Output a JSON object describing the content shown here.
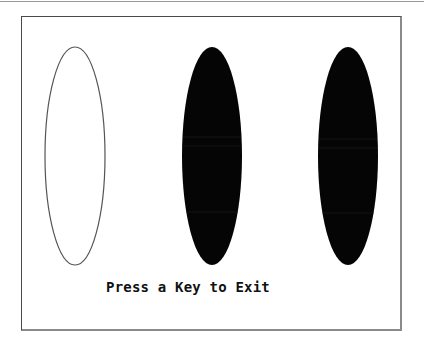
{
  "screen": {
    "prompt_text": "Press a Key to Exit",
    "background_color": "#ffffff",
    "frame_color": "#4a4a4a"
  },
  "shapes": [
    {
      "id": "ellipse-outline",
      "cx": 75,
      "cy": 156,
      "rx": 30,
      "ry": 109,
      "fill": "none",
      "stroke": "#555555"
    },
    {
      "id": "ellipse-filled-middle",
      "cx": 212,
      "cy": 156,
      "rx": 30,
      "ry": 109,
      "fill": "#050505",
      "stroke": "none"
    },
    {
      "id": "ellipse-filled-right",
      "cx": 348,
      "cy": 156,
      "rx": 30,
      "ry": 109,
      "fill": "#050505",
      "stroke": "none"
    }
  ]
}
